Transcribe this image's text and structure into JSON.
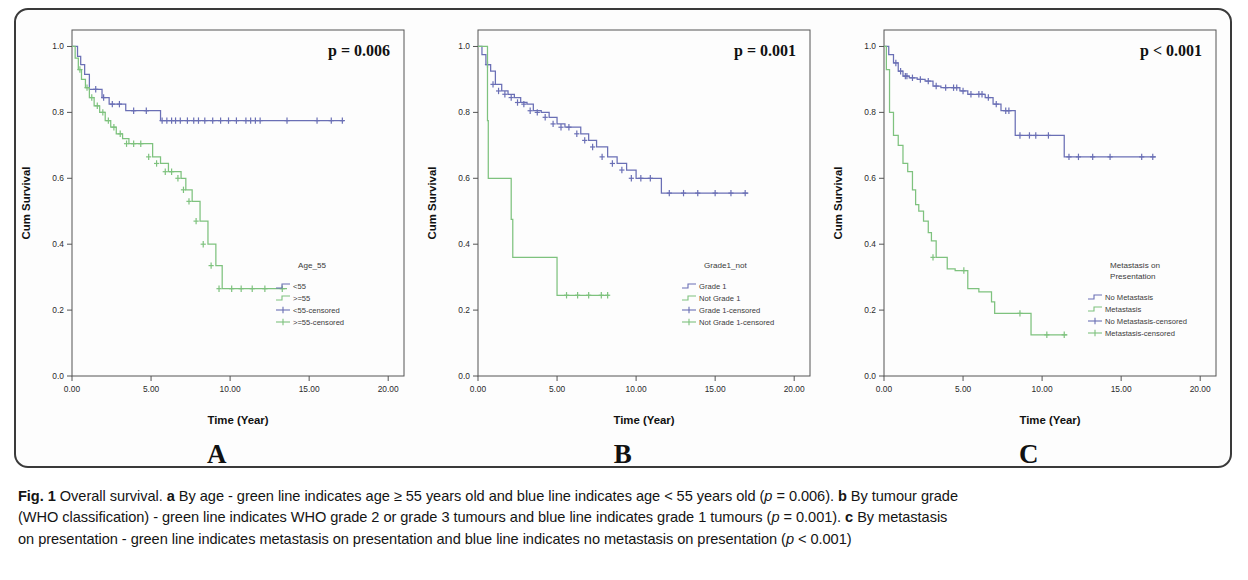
{
  "figure": {
    "id": "Fig. 1",
    "title": "Overall survival.",
    "letters": [
      "A",
      "B",
      "C"
    ],
    "caption_lines": [
      [
        {
          "t": "Fig. 1",
          "b": true
        },
        {
          "t": " Overall survival. "
        },
        {
          "t": "a",
          "b": true
        },
        {
          "t": " By age - green line indicates age ≥ 55 years old and blue line indicates age < 55 years old ("
        },
        {
          "t": "p",
          "i": true
        },
        {
          "t": " = 0.006). "
        },
        {
          "t": "b",
          "b": true
        },
        {
          "t": " By tumour grade"
        }
      ],
      [
        {
          "t": "(WHO classification) - green line indicates WHO grade 2 or grade 3 tumours and blue line indicates grade 1 tumours ("
        },
        {
          "t": "p",
          "i": true
        },
        {
          "t": " = 0.001). "
        },
        {
          "t": "c",
          "b": true
        },
        {
          "t": " By metastasis"
        }
      ],
      [
        {
          "t": "on presentation - green line indicates metastasis on presentation and blue line indicates no metastasis on presentation ("
        },
        {
          "t": "p",
          "i": true
        },
        {
          "t": " < 0.001)"
        }
      ]
    ]
  },
  "colors": {
    "blue": "#6a6fb5",
    "green": "#7ec27e",
    "axis": "#555555",
    "text": "#2b2b2b",
    "plot_bg": "#fdfdfd",
    "frame": "#3a3a3a"
  },
  "axes": {
    "x_label": "Time (Year)",
    "y_label": "Cum Survival",
    "x_ticks": [
      "0.00",
      "5.00",
      "10.00",
      "15.00",
      "20.00"
    ],
    "x_tick_values": [
      0,
      5,
      10,
      15,
      20
    ],
    "y_ticks": [
      "0.0",
      "0.2",
      "0.4",
      "0.6",
      "0.8",
      "1.0"
    ],
    "y_tick_values": [
      0.0,
      0.2,
      0.4,
      0.6,
      0.8,
      1.0
    ],
    "xlim": [
      0,
      21
    ],
    "ylim": [
      0,
      1.05
    ]
  },
  "chart_data": [
    {
      "type": "line",
      "panel": "A",
      "letter": "A",
      "title": "",
      "xlabel": "Time (Year)",
      "ylabel": "Cum Survival",
      "xlim": [
        0,
        21
      ],
      "ylim": [
        0,
        1.05
      ],
      "grid": false,
      "annotation": "p = 0.006",
      "p_value": "p = 0.006",
      "legend_title": "Age_55",
      "legend_position": "inside-bottom-right",
      "legend": [
        "<55",
        ">=55",
        "<55-censored",
        ">=55-censored"
      ],
      "series": [
        {
          "name": "<55",
          "color": "#6a6fb5",
          "step": true,
          "x": [
            0.0,
            0.35,
            0.55,
            0.8,
            1.1,
            1.45,
            1.9,
            2.35,
            2.9,
            3.4,
            4.2,
            5.0,
            5.6,
            17.2
          ],
          "y": [
            1.0,
            0.97,
            0.945,
            0.915,
            0.87,
            0.87,
            0.845,
            0.825,
            0.825,
            0.805,
            0.805,
            0.805,
            0.775,
            0.775
          ],
          "censored_x": [
            1.5,
            2.0,
            2.55,
            3.0,
            3.9,
            4.7,
            5.7,
            6.0,
            6.3,
            6.55,
            6.85,
            7.3,
            7.7,
            8.0,
            8.4,
            8.9,
            9.4,
            9.9,
            10.4,
            11.0,
            11.3,
            11.6,
            11.9,
            13.6,
            15.5,
            16.4,
            17.1
          ],
          "censored_y": [
            0.87,
            0.845,
            0.825,
            0.825,
            0.805,
            0.805,
            0.775,
            0.775,
            0.775,
            0.775,
            0.775,
            0.775,
            0.775,
            0.775,
            0.775,
            0.775,
            0.775,
            0.775,
            0.775,
            0.775,
            0.775,
            0.775,
            0.775,
            0.775,
            0.775,
            0.775,
            0.775
          ]
        },
        {
          "name": ">=55",
          "color": "#7ec27e",
          "step": true,
          "x": [
            0.0,
            0.2,
            0.4,
            0.6,
            0.85,
            1.1,
            1.4,
            1.75,
            2.1,
            2.45,
            2.8,
            3.2,
            3.6,
            4.1,
            4.6,
            5.1,
            5.6,
            6.1,
            6.5,
            6.9,
            7.2,
            7.6,
            8.1,
            8.6,
            9.1,
            9.5,
            13.6
          ],
          "y": [
            1.0,
            0.965,
            0.93,
            0.9,
            0.875,
            0.845,
            0.82,
            0.8,
            0.775,
            0.755,
            0.735,
            0.72,
            0.705,
            0.705,
            0.705,
            0.665,
            0.645,
            0.62,
            0.62,
            0.6,
            0.565,
            0.53,
            0.47,
            0.4,
            0.335,
            0.265,
            0.265
          ],
          "censored_x": [
            0.5,
            0.95,
            1.25,
            1.6,
            1.95,
            2.3,
            2.65,
            3.05,
            3.45,
            3.9,
            4.35,
            4.85,
            5.35,
            5.9,
            6.3,
            6.7,
            7.05,
            7.4,
            7.85,
            8.3,
            8.8,
            9.3,
            10.1,
            10.7,
            11.4,
            12.2,
            13.3
          ],
          "censored_y": [
            0.93,
            0.875,
            0.845,
            0.82,
            0.8,
            0.775,
            0.755,
            0.735,
            0.705,
            0.705,
            0.705,
            0.665,
            0.645,
            0.62,
            0.62,
            0.6,
            0.565,
            0.53,
            0.47,
            0.4,
            0.335,
            0.265,
            0.265,
            0.265,
            0.265,
            0.265,
            0.265
          ]
        }
      ]
    },
    {
      "type": "line",
      "panel": "B",
      "letter": "B",
      "title": "",
      "xlabel": "Time (Year)",
      "ylabel": "Cum Survival",
      "xlim": [
        0,
        21
      ],
      "ylim": [
        0,
        1.05
      ],
      "grid": false,
      "annotation": "p = 0.001",
      "p_value": "p = 0.001",
      "legend_title": "Grade1_not",
      "legend_position": "inside-bottom-right",
      "legend": [
        "Grade 1",
        "Not Grade 1",
        "Grade 1-censored",
        "Not Grade 1-censored"
      ],
      "series": [
        {
          "name": "Grade 1",
          "color": "#6a6fb5",
          "step": true,
          "x": [
            0.0,
            0.25,
            0.5,
            0.8,
            1.1,
            1.5,
            1.9,
            2.3,
            2.7,
            3.1,
            3.5,
            4.0,
            4.5,
            5.0,
            5.5,
            6.0,
            6.5,
            7.0,
            7.5,
            8.2,
            8.8,
            9.4,
            10.0,
            10.6,
            11.2,
            11.6,
            17.1
          ],
          "y": [
            1.0,
            0.975,
            0.945,
            0.925,
            0.885,
            0.865,
            0.855,
            0.845,
            0.83,
            0.825,
            0.805,
            0.8,
            0.785,
            0.765,
            0.755,
            0.755,
            0.735,
            0.715,
            0.695,
            0.665,
            0.645,
            0.625,
            0.6,
            0.6,
            0.6,
            0.555,
            0.555
          ],
          "censored_x": [
            0.6,
            0.95,
            1.3,
            1.7,
            2.1,
            2.5,
            2.9,
            3.3,
            3.75,
            4.25,
            4.75,
            5.25,
            5.75,
            6.25,
            6.75,
            7.25,
            7.85,
            8.5,
            9.1,
            9.7,
            10.3,
            10.9,
            12.1,
            13.0,
            13.9,
            15.0,
            16.0,
            16.9
          ],
          "censored_y": [
            0.945,
            0.885,
            0.865,
            0.855,
            0.845,
            0.83,
            0.825,
            0.805,
            0.8,
            0.785,
            0.765,
            0.755,
            0.755,
            0.735,
            0.715,
            0.695,
            0.665,
            0.645,
            0.625,
            0.6,
            0.6,
            0.6,
            0.555,
            0.555,
            0.555,
            0.555,
            0.555,
            0.555
          ]
        },
        {
          "name": "Not Grade 1",
          "color": "#7ec27e",
          "step": true,
          "x": [
            0.0,
            0.55,
            0.6,
            0.65,
            1.0,
            2.0,
            2.1,
            2.2,
            2.3,
            5.0,
            8.3
          ],
          "y": [
            1.0,
            1.0,
            0.775,
            0.6,
            0.6,
            0.6,
            0.475,
            0.36,
            0.36,
            0.245,
            0.245
          ],
          "censored_x": [
            5.6,
            6.3,
            7.0,
            7.8,
            8.2
          ],
          "censored_y": [
            0.245,
            0.245,
            0.245,
            0.245,
            0.245
          ]
        }
      ]
    },
    {
      "type": "line",
      "panel": "C",
      "letter": "C",
      "title": "",
      "xlabel": "Time (Year)",
      "ylabel": "Cum Survival",
      "xlim": [
        0,
        21
      ],
      "ylim": [
        0,
        1.05
      ],
      "grid": false,
      "annotation": "p < 0.001",
      "p_value": "p < 0.001",
      "legend_title": "Metastasis on Presentation",
      "legend_title_lines": [
        "Metastasis on",
        "Presentation"
      ],
      "legend_position": "inside-bottom-right",
      "legend": [
        "No Metastasis",
        "Metastasis",
        "No Metastasis-censored",
        "Metastasis-censored"
      ],
      "series": [
        {
          "name": "No Metastasis",
          "color": "#6a6fb5",
          "step": true,
          "x": [
            0.0,
            0.3,
            0.6,
            0.9,
            1.2,
            1.6,
            2.1,
            2.6,
            3.1,
            3.6,
            4.2,
            4.8,
            5.3,
            5.9,
            6.4,
            6.9,
            7.4,
            8.1,
            8.3,
            9.0,
            10.0,
            11.1,
            11.4,
            17.2
          ],
          "y": [
            1.0,
            0.975,
            0.95,
            0.925,
            0.91,
            0.905,
            0.9,
            0.895,
            0.88,
            0.875,
            0.875,
            0.865,
            0.855,
            0.855,
            0.845,
            0.825,
            0.805,
            0.805,
            0.73,
            0.73,
            0.73,
            0.73,
            0.665,
            0.665
          ],
          "censored_x": [
            0.75,
            1.05,
            1.35,
            1.45,
            1.8,
            2.3,
            2.8,
            3.3,
            3.9,
            4.4,
            4.6,
            5.0,
            5.5,
            6.0,
            6.2,
            6.6,
            7.1,
            7.7,
            7.9,
            8.6,
            9.2,
            9.6,
            10.4,
            11.7,
            12.3,
            13.2,
            14.3,
            16.3,
            17.0
          ],
          "censored_y": [
            0.95,
            0.925,
            0.91,
            0.91,
            0.905,
            0.9,
            0.895,
            0.88,
            0.875,
            0.875,
            0.875,
            0.865,
            0.855,
            0.855,
            0.855,
            0.845,
            0.825,
            0.805,
            0.805,
            0.73,
            0.73,
            0.73,
            0.73,
            0.665,
            0.665,
            0.665,
            0.665,
            0.665,
            0.665
          ]
        },
        {
          "name": "Metastasis",
          "color": "#7ec27e",
          "step": true,
          "x": [
            0.0,
            0.15,
            0.35,
            0.6,
            0.9,
            1.2,
            1.5,
            1.8,
            2.0,
            2.2,
            2.5,
            2.8,
            3.0,
            3.3,
            3.6,
            4.0,
            4.5,
            5.0,
            5.3,
            6.0,
            6.8,
            7.0,
            8.0,
            9.1,
            9.3,
            11.6
          ],
          "y": [
            1.0,
            0.93,
            0.8,
            0.73,
            0.7,
            0.645,
            0.62,
            0.565,
            0.52,
            0.5,
            0.47,
            0.435,
            0.41,
            0.36,
            0.36,
            0.325,
            0.32,
            0.32,
            0.265,
            0.255,
            0.225,
            0.19,
            0.19,
            0.19,
            0.125,
            0.125
          ],
          "censored_x": [
            3.1,
            5.05,
            8.6,
            10.3,
            11.4
          ],
          "censored_y": [
            0.36,
            0.32,
            0.19,
            0.125,
            0.125
          ]
        }
      ]
    }
  ]
}
